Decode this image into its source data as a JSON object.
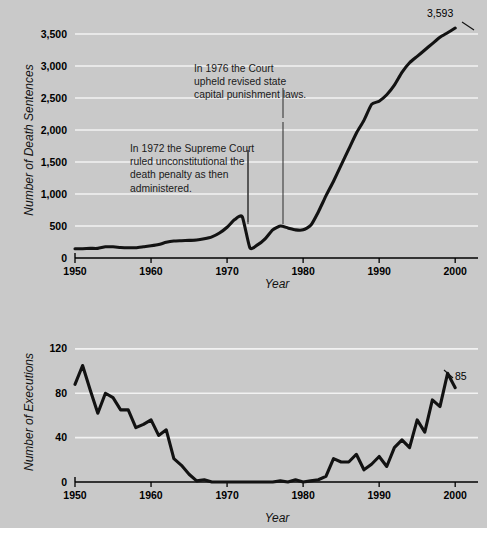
{
  "figure": {
    "background_color": "#c9c9c9",
    "page_color": "#ffffff",
    "line_color": "#121212",
    "gridline_color": "#f2f2f2"
  },
  "chart_data": [
    {
      "type": "line",
      "id": "death-sentences",
      "title": "",
      "xlabel": "Year",
      "ylabel": "Number of Death Sentences",
      "xlim": [
        1950,
        2003
      ],
      "ylim": [
        0,
        3750
      ],
      "xticks": [
        1950,
        1960,
        1970,
        1980,
        1990,
        2000
      ],
      "yticks": [
        0,
        500,
        1000,
        1500,
        2000,
        2500,
        3000,
        3500
      ],
      "ytick_labels": [
        "0",
        "500",
        "1,000",
        "1,500",
        "2,000",
        "2,500",
        "3,000",
        "3,500"
      ],
      "xtick_labels": [
        "1950",
        "1960",
        "1970",
        "1980",
        "1990",
        "2000"
      ],
      "grid": true,
      "legend": "none",
      "endpoint_label": "3,593",
      "x": [
        1950,
        1951,
        1952,
        1953,
        1954,
        1955,
        1956,
        1957,
        1958,
        1959,
        1960,
        1961,
        1962,
        1963,
        1964,
        1965,
        1966,
        1967,
        1968,
        1969,
        1970,
        1971,
        1972,
        1973,
        1974,
        1975,
        1976,
        1977,
        1978,
        1979,
        1980,
        1981,
        1982,
        1983,
        1984,
        1985,
        1986,
        1987,
        1988,
        1989,
        1990,
        1991,
        1992,
        1993,
        1994,
        1995,
        1996,
        1997,
        1998,
        1999,
        2000
      ],
      "values": [
        145,
        145,
        150,
        150,
        175,
        175,
        165,
        160,
        160,
        175,
        190,
        210,
        245,
        265,
        270,
        275,
        280,
        300,
        330,
        390,
        480,
        600,
        645,
        160,
        205,
        300,
        440,
        500,
        470,
        440,
        440,
        510,
        720,
        970,
        1200,
        1450,
        1700,
        1950,
        2150,
        2400,
        2450,
        2550,
        2700,
        2900,
        3050,
        3150,
        3250,
        3350,
        3450,
        3520,
        3593
      ],
      "annotations": [
        {
          "id": "annotation-1972",
          "lines": [
            "In 1972 the Supreme Court",
            "ruled unconstitutional the",
            "death penalty as then",
            "administered."
          ],
          "points_to_year": 1972
        },
        {
          "id": "annotation-1976",
          "lines": [
            "In 1976 the Court",
            "upheld revised state",
            "capital punishment laws."
          ],
          "points_to_year": 1976
        }
      ]
    },
    {
      "type": "line",
      "id": "executions",
      "title": "",
      "xlabel": "Year",
      "ylabel": "Number of Executions",
      "xlim": [
        1950,
        2003
      ],
      "ylim": [
        0,
        128
      ],
      "xticks": [
        1950,
        1960,
        1970,
        1980,
        1990,
        2000
      ],
      "yticks": [
        0,
        40,
        80,
        120
      ],
      "ytick_labels": [
        "0",
        "40",
        "80",
        "120"
      ],
      "xtick_labels": [
        "1950",
        "1960",
        "1970",
        "1980",
        "1990",
        "2000"
      ],
      "grid": true,
      "legend": "none",
      "endpoint_label": "85",
      "x": [
        1950,
        1951,
        1952,
        1953,
        1954,
        1955,
        1956,
        1957,
        1958,
        1959,
        1960,
        1961,
        1962,
        1963,
        1964,
        1965,
        1966,
        1967,
        1968,
        1969,
        1970,
        1971,
        1972,
        1973,
        1974,
        1975,
        1976,
        1977,
        1978,
        1979,
        1980,
        1981,
        1982,
        1983,
        1984,
        1985,
        1986,
        1987,
        1988,
        1989,
        1990,
        1991,
        1992,
        1993,
        1994,
        1995,
        1996,
        1997,
        1998,
        1999,
        2000
      ],
      "values": [
        88,
        105,
        83,
        62,
        80,
        76,
        65,
        65,
        49,
        52,
        56,
        42,
        47,
        21,
        15,
        7,
        1,
        2,
        0,
        0,
        0,
        0,
        0,
        0,
        0,
        0,
        0,
        1,
        0,
        2,
        0,
        1,
        2,
        5,
        21,
        18,
        18,
        25,
        11,
        16,
        23,
        14,
        31,
        38,
        31,
        56,
        45,
        74,
        68,
        98,
        85
      ]
    }
  ]
}
